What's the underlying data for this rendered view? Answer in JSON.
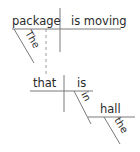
{
  "diagram": {
    "type": "sentence-diagram",
    "main_clause": {
      "subject": "package",
      "verb": "is moving",
      "modifiers": [
        {
          "word": "The",
          "modifies": "package"
        }
      ]
    },
    "relative_clause": {
      "subject": "that",
      "verb": "is",
      "prepositional_phrase": {
        "preposition": "in",
        "object": "hall",
        "modifiers": [
          {
            "word": "the",
            "modifies": "hall"
          }
        ]
      }
    },
    "colors": {
      "line": "#7a7a7a",
      "text": "#2a2a2a"
    }
  }
}
